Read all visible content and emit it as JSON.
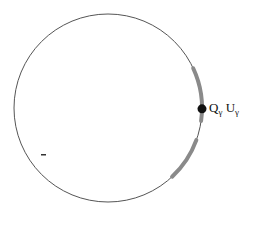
{
  "diagram": {
    "circle": {
      "cx": 108,
      "cy": 108,
      "r": 94,
      "stroke": "#555555",
      "stroke_width": 1
    },
    "arcs": [
      {
        "name": "upper-arc",
        "start_deg": -25,
        "end_deg": 8,
        "color": "#8a8a8a",
        "width": 4
      },
      {
        "name": "lower-arc",
        "start_deg": 20,
        "end_deg": 47,
        "color": "#8a8a8a",
        "width": 4
      }
    ],
    "point": {
      "angle_deg": 0.5,
      "r_dot": 4.5,
      "color": "#111111"
    },
    "label": {
      "parts": [
        {
          "base": "Q",
          "sub": "γ"
        },
        {
          "base": "U",
          "sub": "γ"
        }
      ],
      "x": 209,
      "y": 100
    },
    "mark": {
      "x": 41,
      "y": 154,
      "w": 5,
      "h": 1.5,
      "color": "#333333"
    }
  }
}
